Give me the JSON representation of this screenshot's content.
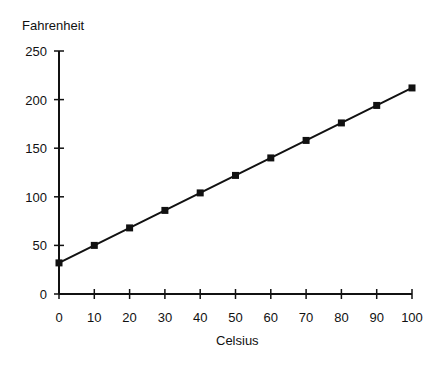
{
  "chart_data": {
    "type": "line",
    "title": "",
    "xlabel": "Celsius",
    "ylabel": "Fahrenheit",
    "x": [
      0,
      10,
      20,
      30,
      40,
      50,
      60,
      70,
      80,
      90,
      100
    ],
    "series": [
      {
        "name": "Fahrenheit",
        "values": [
          32,
          50,
          68,
          86,
          104,
          122,
          140,
          158,
          176,
          194,
          212
        ]
      }
    ],
    "xlim": [
      0,
      100
    ],
    "ylim": [
      0,
      250
    ],
    "xticks": [
      0,
      10,
      20,
      30,
      40,
      50,
      60,
      70,
      80,
      90,
      100
    ],
    "yticks": [
      0,
      50,
      100,
      150,
      200,
      250
    ],
    "grid": false,
    "legend": null,
    "marker": "square",
    "line_color": "#111111"
  }
}
